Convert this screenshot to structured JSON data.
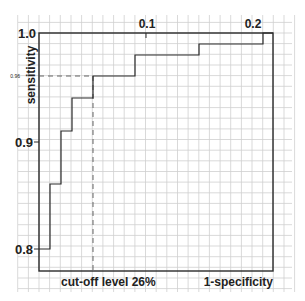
{
  "chart_data": {
    "type": "line",
    "subtype": "step (ROC curve)",
    "title": "",
    "xlabel": "1-specificity",
    "ylabel": "sensitivity",
    "annotation": "cut-off level 26%",
    "x_ticks": [
      "0.1",
      "0.2"
    ],
    "y_ticks": [
      "1.0",
      "0.96",
      "0.9",
      "0.8"
    ],
    "xlim": [
      0,
      0.21
    ],
    "ylim": [
      0.78,
      1.0
    ],
    "grid": true,
    "series": [
      {
        "name": "ROC",
        "points": [
          {
            "x": 0.0,
            "y": 0.8
          },
          {
            "x": 0.01,
            "y": 0.8
          },
          {
            "x": 0.01,
            "y": 0.86
          },
          {
            "x": 0.02,
            "y": 0.86
          },
          {
            "x": 0.02,
            "y": 0.91
          },
          {
            "x": 0.031,
            "y": 0.91
          },
          {
            "x": 0.031,
            "y": 0.94
          },
          {
            "x": 0.05,
            "y": 0.94
          },
          {
            "x": 0.05,
            "y": 0.96
          },
          {
            "x": 0.089,
            "y": 0.96
          },
          {
            "x": 0.089,
            "y": 0.98
          },
          {
            "x": 0.15,
            "y": 0.98
          },
          {
            "x": 0.15,
            "y": 0.99
          },
          {
            "x": 0.21,
            "y": 0.99
          },
          {
            "x": 0.21,
            "y": 1.0
          }
        ]
      }
    ],
    "cutoff_marker": {
      "x": 0.05,
      "y": 0.96,
      "label": "cut-off level 26%",
      "style": "dashed"
    }
  },
  "labels": {
    "xlabel": "1-specificity",
    "ylabel": "sensitivity",
    "cutoff": "cut-off level 26%",
    "x_tick_01": "0.1",
    "x_tick_02": "0.2",
    "y_tick_10": "1.0",
    "y_tick_096": "0.96",
    "y_tick_09": "0.9",
    "y_tick_08": "0.8"
  },
  "colors": {
    "line": "#2a2a2a",
    "grid": "#cfcfcf",
    "text": "#222222"
  }
}
